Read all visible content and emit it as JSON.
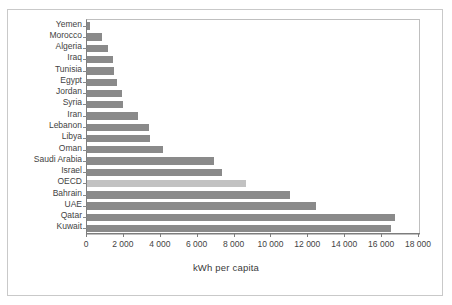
{
  "figure": {
    "top_partial_text": "",
    "border_color": "#c9c9c9"
  },
  "chart_data": {
    "type": "bar",
    "orientation": "horizontal",
    "title": "",
    "xlabel": "kWh per capita",
    "ylabel": "",
    "xlim": [
      0,
      18000
    ],
    "xticks": [
      0,
      2000,
      4000,
      6000,
      8000,
      10000,
      12000,
      14000,
      16000,
      18000
    ],
    "xtick_labels": [
      "0",
      "2 000",
      "4 000",
      "6 000",
      "8 000",
      "10 000",
      "12 000",
      "14 000",
      "16 000",
      "18 000"
    ],
    "grid": false,
    "legend": null,
    "bar_color": "#8a8a8a",
    "highlight_color": "#c2c2c2",
    "highlight_category": "OECD",
    "categories": [
      "Yemen",
      "Morocco",
      "Algeria",
      "Iraq",
      "Tunisia",
      "Egypt",
      "Jordan",
      "Syria",
      "Iran",
      "Lebanon",
      "Libya",
      "Oman",
      "Saudi Arabia",
      "Israel",
      "OECD",
      "Bahrain",
      "UAE",
      "Qatar",
      "Kuwait"
    ],
    "values": [
      180,
      800,
      1150,
      1400,
      1450,
      1650,
      1900,
      1950,
      2750,
      3350,
      3400,
      4100,
      6900,
      7300,
      8600,
      11000,
      12400,
      16700,
      16500
    ]
  }
}
